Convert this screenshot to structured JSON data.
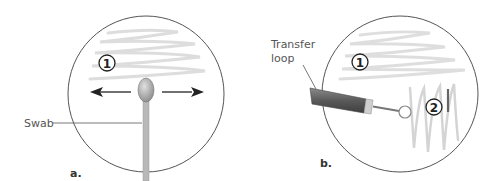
{
  "panels": [
    {
      "id": "a",
      "panel_label": "a.",
      "tool_label": "Swab",
      "step_markers": [
        "1"
      ],
      "arrows": [
        "left",
        "right"
      ]
    },
    {
      "id": "b",
      "panel_label": "b.",
      "tool_label_line1": "Transfer",
      "tool_label_line2": "loop",
      "step_markers": [
        "1",
        "2"
      ]
    }
  ],
  "colors": {
    "plate_outline": "#555555",
    "streak": "#d8d8d8",
    "swab_stick": "#b5b5b5",
    "swab_tip": "#a8a8a8",
    "loop_handle": "#666666",
    "arrow": "#222222"
  }
}
